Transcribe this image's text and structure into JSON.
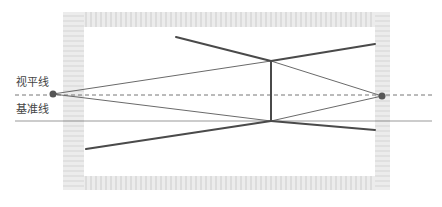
{
  "labels": {
    "horizon_line": "视平线",
    "base_line": "基准线"
  },
  "caption": "",
  "colors": {
    "frame_hatch": "#e4e4e4",
    "frame_hatch_dark": "#d6d6d6",
    "thick_line": "#4a4a4a",
    "thin_line": "#6a6a6a",
    "dashed_line": "#777777",
    "base_line": "#999999",
    "vanishing_point": "#555555"
  },
  "geometry": {
    "frame": {
      "outer": [
        63,
        12,
        390,
        190
      ],
      "inner": [
        84,
        27,
        375,
        176
      ]
    },
    "horizon_y": 95,
    "baseline_y": 121,
    "vanishing_points": {
      "left": [
        53,
        94
      ],
      "right": [
        382,
        96
      ]
    },
    "vertical_edge": {
      "x": 271,
      "top": 61,
      "bottom": 121
    }
  }
}
